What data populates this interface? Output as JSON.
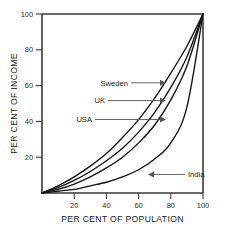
{
  "chart_data": {
    "type": "line",
    "title": "",
    "subtitle": "",
    "xlabel": "PER CENT OF POPULATION",
    "ylabel": "PER CENT OF INCOME",
    "xlim": [
      0,
      100
    ],
    "ylim": [
      0,
      100
    ],
    "xticks": [
      20,
      40,
      60,
      80,
      100
    ],
    "yticks": [
      20,
      40,
      60,
      80,
      100
    ],
    "xticklabels": [
      "20",
      "40",
      "60",
      "80",
      "100"
    ],
    "yticklabels": [
      "20",
      "40",
      "60",
      "80",
      "100"
    ],
    "grid": false,
    "legend": "none",
    "legend_position": "inline-annotations",
    "x": [
      0,
      10,
      20,
      30,
      40,
      50,
      60,
      70,
      80,
      90,
      100
    ],
    "series": [
      {
        "name": "Sweden",
        "label": "Sweden",
        "values": [
          0,
          4,
          9,
          15,
          22,
          31,
          41,
          53,
          67,
          82,
          100
        ]
      },
      {
        "name": "UK",
        "label": "UK",
        "values": [
          0,
          3,
          7,
          12,
          18,
          25,
          34,
          45,
          59,
          76,
          100
        ]
      },
      {
        "name": "USA",
        "label": "USA",
        "values": [
          0,
          2,
          5,
          9,
          14,
          20,
          28,
          38,
          52,
          71,
          100
        ]
      },
      {
        "name": "India",
        "label": "India",
        "values": [
          0,
          1,
          2,
          4,
          6,
          9,
          13,
          19,
          28,
          48,
          100
        ]
      }
    ],
    "annotations": [
      {
        "text": "Sweden",
        "points_to_series": "Sweden",
        "arrow_direction": "right",
        "at_y": 60
      },
      {
        "text": "UK",
        "points_to_series": "UK",
        "arrow_direction": "right",
        "at_y": 50
      },
      {
        "text": "USA",
        "points_to_series": "USA",
        "arrow_direction": "right",
        "at_y": 40
      },
      {
        "text": "India",
        "points_to_series": "India",
        "arrow_direction": "left",
        "at_y": 9
      }
    ]
  },
  "axes": {
    "x_title": "PER CENT OF POPULATION",
    "y_title": "PER CENT OF INCOME",
    "x_ticks": [
      "20",
      "40",
      "60",
      "80",
      "100"
    ],
    "y_ticks": [
      "20",
      "40",
      "60",
      "80",
      "100"
    ]
  },
  "annotations": {
    "sweden": "Sweden",
    "uk": "UK",
    "usa": "USA",
    "india": "India"
  },
  "colors": {
    "curve": "#121212",
    "axis": "#3a3a3a",
    "leader": "#555555",
    "background": "#ffffff"
  }
}
